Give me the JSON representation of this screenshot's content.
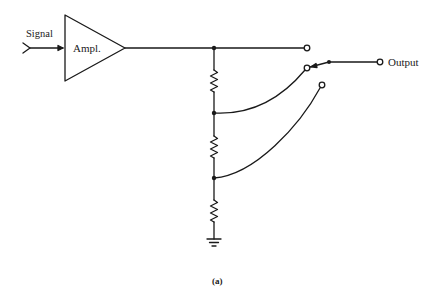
{
  "diagram": {
    "type": "circuit-schematic",
    "caption": "(a)",
    "labels": {
      "input": "Signal",
      "amplifier": "Ampl.",
      "output": "Output"
    },
    "components": [
      {
        "id": "input-connector",
        "kind": "signal-input"
      },
      {
        "id": "amplifier",
        "kind": "amplifier-triangle"
      },
      {
        "id": "r1",
        "kind": "resistor"
      },
      {
        "id": "r2",
        "kind": "resistor"
      },
      {
        "id": "r3",
        "kind": "resistor"
      },
      {
        "id": "ground",
        "kind": "ground"
      },
      {
        "id": "switch",
        "kind": "rotary-selector-switch",
        "positions": 3,
        "selected_position": 2
      },
      {
        "id": "output-terminal",
        "kind": "terminal"
      }
    ],
    "stroke_color": "#1a1a1a",
    "background": "#ffffff"
  }
}
